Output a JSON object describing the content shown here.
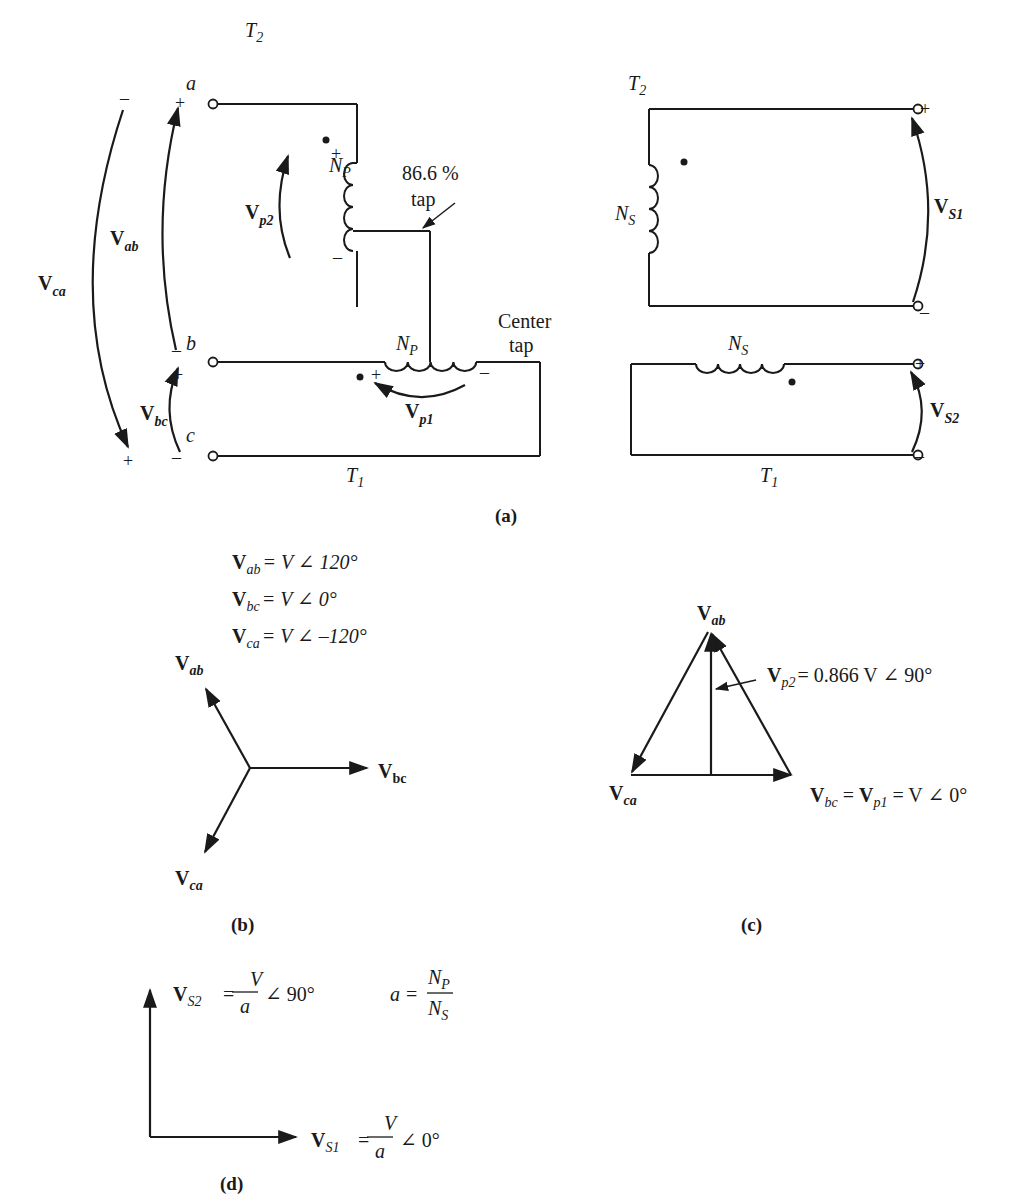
{
  "figure": {
    "panels": {
      "a": {
        "caption": "(a)",
        "left_circuit": {
          "transformer_top": "T",
          "transformer_top_sub": "2",
          "transformer_bottom": "T",
          "transformer_bottom_sub": "1",
          "terminals": [
            "a",
            "b",
            "c"
          ],
          "winding_top": {
            "name": "N",
            "sub": "P"
          },
          "winding_bottom": {
            "name": "N",
            "sub": "P"
          },
          "tap_label_line1": "86.6 %",
          "tap_label_line2": "tap",
          "center_tap_line1": "Center",
          "center_tap_line2": "tap",
          "voltages": {
            "Vca": {
              "main": "V",
              "sub": "ca"
            },
            "Vab": {
              "main": "V",
              "sub": "ab"
            },
            "Vbc": {
              "main": "V",
              "sub": "bc"
            },
            "Vp2": {
              "main": "V",
              "sub": "p2"
            },
            "Vp1": {
              "main": "V",
              "sub": "p1"
            }
          },
          "signs": {
            "plus": "+",
            "minus": "–"
          }
        },
        "right_circuit": {
          "transformer_top": "T",
          "transformer_top_sub": "2",
          "transformer_bottom": "T",
          "transformer_bottom_sub": "1",
          "winding_top": {
            "name": "N",
            "sub": "S"
          },
          "winding_bottom": {
            "name": "N",
            "sub": "S"
          },
          "voltages": {
            "Vs1": {
              "main": "V",
              "sub": "S1"
            },
            "Vs2": {
              "main": "V",
              "sub": "S2"
            }
          }
        }
      },
      "b": {
        "caption": "(b)",
        "equations": [
          {
            "main": "V",
            "sub": "ab",
            "rhs": "= V ∠ 120°"
          },
          {
            "main": "V",
            "sub": "bc",
            "rhs": "= V ∠ 0°"
          },
          {
            "main": "V",
            "sub": "ca",
            "rhs": "= V ∠ –120°"
          }
        ],
        "phasors": [
          {
            "main": "V",
            "sub": "ab",
            "angle_deg": 120
          },
          {
            "main": "V",
            "sub": "bc",
            "angle_deg": 0
          },
          {
            "main": "V",
            "sub": "ca",
            "angle_deg": -120
          }
        ]
      },
      "c": {
        "caption": "(c)",
        "apex_label": {
          "main": "V",
          "sub": "ab"
        },
        "left_label": {
          "main": "V",
          "sub": "ca"
        },
        "vp2_label": {
          "main": "V",
          "sub": "p2",
          "rhs": "= 0.866 V ∠ 90°"
        },
        "bottom_label": {
          "main1": "V",
          "sub1": "bc",
          "eq1": " = ",
          "main2": "V",
          "sub2": "p1",
          "rhs": " = V ∠ 0°"
        }
      },
      "d": {
        "caption": "(d)",
        "vs2": {
          "main": "V",
          "sub": "S2",
          "eq": "=",
          "num": "V",
          "den": "a",
          "angle": "∠ 90°"
        },
        "vs1": {
          "main": "V",
          "sub": "S1",
          "eq": "=",
          "num": "V",
          "den": "a",
          "angle": "∠ 0°"
        },
        "ratio": {
          "lhs": "a",
          "eq": "=",
          "num_main": "N",
          "num_sub": "P",
          "den_main": "N",
          "den_sub": "S"
        }
      }
    }
  }
}
